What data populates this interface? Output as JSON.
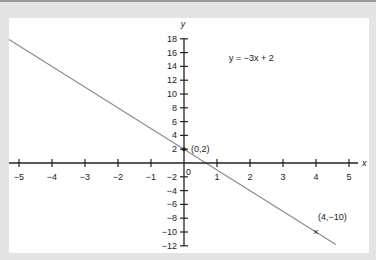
{
  "chart_data": {
    "type": "line",
    "title": "",
    "equation_label": "y = −3x +  2",
    "xlabel": "x",
    "ylabel": "y",
    "xlim": [
      -5.3,
      5.3
    ],
    "ylim": [
      -12,
      18
    ],
    "grid": false,
    "legend": null,
    "x_ticks": [
      -5,
      -4,
      -3,
      -2,
      -1,
      0,
      1,
      2,
      3,
      4,
      5
    ],
    "x_tick_labels": [
      "−5",
      "−4",
      "−3",
      "−2",
      "−1",
      "0",
      "1",
      "2",
      "3",
      "4",
      "5"
    ],
    "y_ticks": [
      18,
      16,
      14,
      12,
      10,
      8,
      6,
      4,
      2,
      -2,
      -4,
      -6,
      -8,
      -10,
      -12
    ],
    "y_tick_labels": [
      "18",
      "16",
      "14",
      "12",
      "10",
      "8",
      "6",
      "4",
      "2",
      "−2",
      "−4",
      "−6",
      "−8",
      "−10",
      "−12"
    ],
    "series": [
      {
        "name": "y = -3x + 2",
        "slope": -3,
        "intercept": 2,
        "x": [
          -5.1,
          4.6
        ],
        "y": [
          17.3,
          -11.8
        ],
        "color": "#8c8c8c"
      }
    ],
    "annotations": [
      {
        "x": 0,
        "y": 2,
        "label": "(0,2)",
        "marker": "dot"
      },
      {
        "x": 4,
        "y": -10,
        "label": "(4,−10)",
        "marker": "x"
      }
    ]
  },
  "colors": {
    "background": "#e4e4e4",
    "plot": "#ffffff",
    "axis": "#222222",
    "line": "#8c8c8c"
  }
}
